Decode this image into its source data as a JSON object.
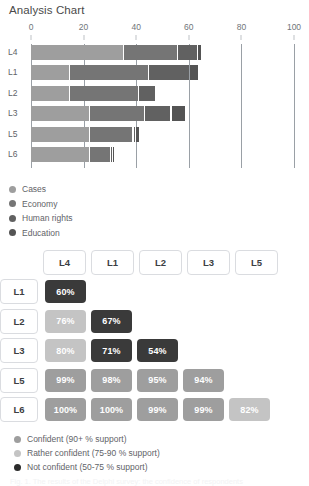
{
  "title": "Analysis Chart",
  "chart_data": {
    "type": "bar",
    "orientation": "horizontal",
    "stacked": true,
    "title": "Analysis Chart",
    "xlabel": "",
    "ylabel": "",
    "xlim": [
      0,
      100
    ],
    "xticks": [
      0,
      20,
      40,
      60,
      80,
      100
    ],
    "grid": true,
    "legend_position": "below",
    "categories": [
      "L4",
      "L1",
      "L2",
      "L3",
      "L5",
      "L6"
    ],
    "series": [
      {
        "name": "Cases",
        "color": "#9e9e9e",
        "values": [
          35.5,
          15.0,
          15.0,
          22.5,
          22.5,
          22.5
        ]
      },
      {
        "name": "Economy",
        "color": "#757575",
        "values": [
          20.5,
          30.0,
          26.0,
          21.0,
          16.5,
          8.0
        ]
      },
      {
        "name": "Human rights",
        "color": "#616161",
        "values": [
          7.5,
          15.5,
          6.5,
          10.0,
          1.0,
          0.7
        ]
      },
      {
        "name": "Education",
        "color": "#545454",
        "values": [
          1.5,
          3.5,
          0.0,
          5.5,
          1.5,
          0.7
        ]
      }
    ]
  },
  "series_legend": [
    {
      "label": "Cases",
      "color": "#9e9e9e"
    },
    {
      "label": "Economy",
      "color": "#757575"
    },
    {
      "label": "Human rights",
      "color": "#616161"
    },
    {
      "label": "Education",
      "color": "#545454"
    }
  ],
  "matrix": {
    "columns": [
      "L4",
      "L1",
      "L2",
      "L3",
      "L5"
    ],
    "rows": [
      {
        "label": "L1",
        "cells": [
          {
            "value": "60%",
            "color": "#3a3a3a"
          }
        ]
      },
      {
        "label": "L2",
        "cells": [
          {
            "value": "76%",
            "color": "#c4c4c4"
          },
          {
            "value": "67%",
            "color": "#3a3a3a"
          }
        ]
      },
      {
        "label": "L3",
        "cells": [
          {
            "value": "80%",
            "color": "#c4c4c4"
          },
          {
            "value": "71%",
            "color": "#3a3a3a"
          },
          {
            "value": "54%",
            "color": "#3a3a3a"
          }
        ]
      },
      {
        "label": "L5",
        "cells": [
          {
            "value": "99%",
            "color": "#9e9e9e"
          },
          {
            "value": "98%",
            "color": "#9e9e9e"
          },
          {
            "value": "95%",
            "color": "#9e9e9e"
          },
          {
            "value": "94%",
            "color": "#9e9e9e"
          }
        ]
      },
      {
        "label": "L6",
        "cells": [
          {
            "value": "100%",
            "color": "#9e9e9e"
          },
          {
            "value": "100%",
            "color": "#9e9e9e"
          },
          {
            "value": "99%",
            "color": "#9e9e9e"
          },
          {
            "value": "99%",
            "color": "#9e9e9e"
          },
          {
            "value": "82%",
            "color": "#c4c4c4"
          }
        ]
      }
    ]
  },
  "confidence_legend": [
    {
      "label": "Confident (90+ % support)",
      "color": "#9e9e9e"
    },
    {
      "label": "Rather confident (75-90 % support)",
      "color": "#c4c4c4"
    },
    {
      "label": "Not confident (50-75 % support)",
      "color": "#2b2b2b"
    }
  ],
  "caption": "Fig. 1.  The results of the Delphi survey: the confidence of respondents"
}
